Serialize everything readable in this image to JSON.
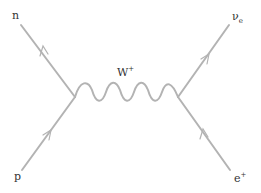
{
  "diagram": {
    "type": "feynman-diagram",
    "line_color": "#b3b3b3",
    "label_color": "#333333",
    "vertices": {
      "left": {
        "x": 75,
        "y": 97
      },
      "right": {
        "x": 178,
        "y": 97
      }
    },
    "particles": {
      "n": {
        "label": "n",
        "role": "outgoing neutron"
      },
      "p": {
        "label": "p",
        "role": "incoming proton"
      },
      "boson": {
        "label": "W",
        "sup": "+",
        "role": "W boson propagator"
      },
      "nu": {
        "label": "ν",
        "sub": "e",
        "role": "electron neutrino"
      },
      "positron": {
        "label": "e",
        "sup": "+",
        "role": "positron"
      }
    }
  }
}
